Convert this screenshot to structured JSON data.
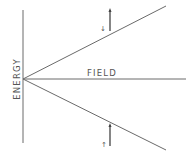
{
  "diagram": {
    "type": "zeeman-splitting",
    "axis_labels": {
      "vertical": "ENERGY",
      "horizontal": "FIELD"
    },
    "branches": [
      {
        "name": "upper",
        "spin_label": "↓",
        "arrow_direction": "up"
      },
      {
        "name": "lower",
        "spin_label": "↑",
        "arrow_direction": "up"
      }
    ],
    "colors": {
      "line": "#6a6a6a",
      "text": "#555555",
      "background": "#ffffff"
    }
  }
}
